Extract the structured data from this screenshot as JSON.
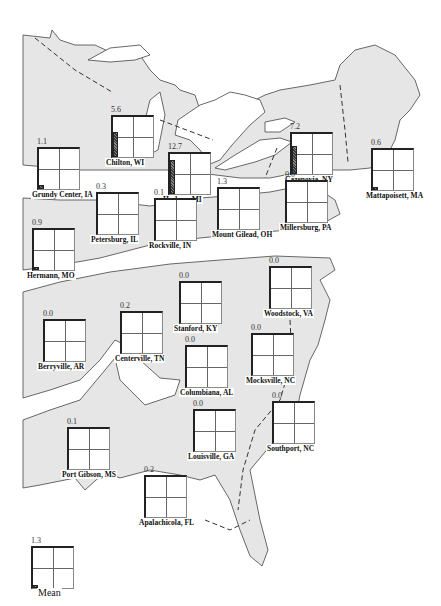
{
  "figure": {
    "type": "map",
    "region": "Eastern United States",
    "legend_label": "Mean"
  },
  "sites": [
    {
      "name": "Grundy Center, IA",
      "value": "1.1",
      "x": 37,
      "y": 147,
      "bar": 4
    },
    {
      "name": "Chilton, WI",
      "value": "5.6",
      "x": 111,
      "y": 115,
      "bar": 25
    },
    {
      "name": "Hudson, MI",
      "value": "12.7",
      "x": 168,
      "y": 152,
      "bar": 34
    },
    {
      "name": "Cazenovia, NY",
      "value": "7.2",
      "x": 290,
      "y": 132,
      "bar": 28
    },
    {
      "name": "Mattapoisett, MA",
      "value": "0.6",
      "x": 371,
      "y": 148,
      "bar": 3
    },
    {
      "name": "Petersburg, IL",
      "value": "0.3",
      "x": 96,
      "y": 192,
      "bar": 0
    },
    {
      "name": "Rockville, IN",
      "value": "0.1",
      "x": 154,
      "y": 198,
      "bar": 0
    },
    {
      "name": "Mount Gilead, OH",
      "value": "1.3",
      "x": 217,
      "y": 187,
      "bar": 0
    },
    {
      "name": "Millersburg, PA",
      "value": "0.0",
      "x": 285,
      "y": 180,
      "bar": 0
    },
    {
      "name": "Hermann, MO",
      "value": "0.9",
      "x": 32,
      "y": 228,
      "bar": 3
    },
    {
      "name": "Woodstock, VA",
      "value": "0.0",
      "x": 269,
      "y": 266,
      "bar": 0
    },
    {
      "name": "Stanford, KY",
      "value": "0.0",
      "x": 179,
      "y": 281,
      "bar": 0
    },
    {
      "name": "Centerville, TN",
      "value": "0.2",
      "x": 120,
      "y": 311,
      "bar": 0
    },
    {
      "name": "Berryville, AR",
      "value": "0.0",
      "x": 43,
      "y": 319,
      "bar": 0
    },
    {
      "name": "Mocksville, NC",
      "value": "0.0",
      "x": 251,
      "y": 333,
      "bar": 0
    },
    {
      "name": "Columbiana, AL",
      "value": "0.0",
      "x": 185,
      "y": 345,
      "bar": 0
    },
    {
      "name": "Southport, NC",
      "value": "0.0",
      "x": 272,
      "y": 401,
      "bar": 0
    },
    {
      "name": "Louisville, GA",
      "value": "0.0",
      "x": 193,
      "y": 409,
      "bar": 0
    },
    {
      "name": "Port Gibson, MS",
      "value": "0.1",
      "x": 67,
      "y": 427,
      "bar": 0
    },
    {
      "name": "Apalachicola, FL",
      "value": "0.2",
      "x": 144,
      "y": 475,
      "bar": 0
    }
  ],
  "mean": {
    "name": "Mean",
    "value": "1.3",
    "x": 31,
    "y": 546,
    "bar": 3
  },
  "colors": {
    "land": "#e6e6e6",
    "outline": "#444444",
    "background": "#ffffff"
  }
}
